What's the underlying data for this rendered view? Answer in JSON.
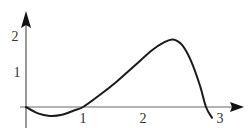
{
  "chart_data": {
    "type": "line",
    "title": "",
    "xlabel": "",
    "ylabel": "",
    "xlim": [
      0,
      3.3
    ],
    "ylim": [
      -0.5,
      2.5
    ],
    "grid": false,
    "legend": null,
    "x_ticks": [
      "1",
      "2",
      "3"
    ],
    "y_ticks": [
      "1",
      "2"
    ],
    "series": [
      {
        "name": "f(x)",
        "color": "#1a1a1a",
        "x": [
          0,
          0.2,
          0.4,
          0.6,
          0.8,
          0.95,
          1.2,
          1.5,
          1.8,
          2.1,
          2.3,
          2.45,
          2.6,
          2.75,
          2.9,
          3.0,
          3.1
        ],
        "y": [
          0,
          -0.18,
          -0.25,
          -0.22,
          -0.1,
          0,
          0.3,
          0.7,
          1.15,
          1.6,
          1.82,
          1.9,
          1.75,
          1.3,
          0.6,
          0,
          -0.3
        ]
      }
    ]
  },
  "axes": {
    "color": "#555555",
    "curve_color": "#1a1a1a",
    "labels": {
      "x1": "1",
      "x2": "2",
      "x3": "3",
      "y1": "1",
      "y2": "2"
    }
  }
}
